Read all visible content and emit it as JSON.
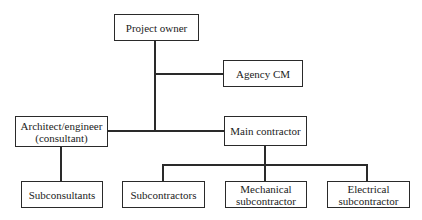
{
  "diagram": {
    "type": "organization-chart",
    "nodes": {
      "project_owner": "Project owner",
      "agency_cm": "Agency CM",
      "architect_engineer": "Architect/engineer\n(consultant)",
      "main_contractor": "Main contractor",
      "subconsultants": "Subconsultants",
      "subcontractors": "Subcontractors",
      "mechanical_subcontractor": "Mechanical\nsubcontractor",
      "electrical_subcontractor": "Electrical\nsubcontractor"
    },
    "edges": [
      [
        "project_owner",
        "agency_cm"
      ],
      [
        "project_owner",
        "architect_engineer"
      ],
      [
        "project_owner",
        "main_contractor"
      ],
      [
        "architect_engineer",
        "subconsultants"
      ],
      [
        "main_contractor",
        "subcontractors"
      ],
      [
        "main_contractor",
        "mechanical_subcontractor"
      ],
      [
        "main_contractor",
        "electrical_subcontractor"
      ]
    ],
    "colors": {
      "line": "#2a2a2a",
      "background": "#ffffff",
      "text": "#222222"
    }
  }
}
